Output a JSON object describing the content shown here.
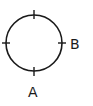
{
  "diagram": {
    "type": "circle-with-ticks",
    "circle": {
      "cx": 34,
      "cy": 43,
      "r": 28,
      "stroke": "#1a1a1a"
    },
    "ticks": [
      "top",
      "left",
      "right",
      "bottom"
    ],
    "labels": {
      "a": {
        "text": "A",
        "position": "below-bottom-tick"
      },
      "b": {
        "text": "B",
        "position": "right-of-right-tick"
      }
    }
  }
}
